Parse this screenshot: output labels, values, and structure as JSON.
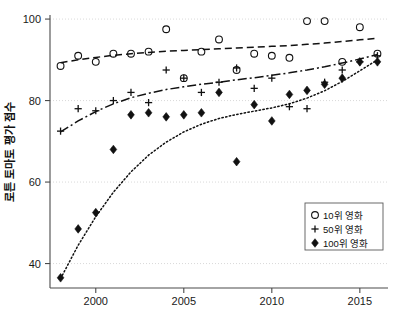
{
  "chart_data": {
    "type": "scatter",
    "title": "",
    "subtitle": "",
    "xlabel": "",
    "ylabel": "로튼 토마토 평가 점수",
    "xlim": [
      1997.4,
      2016.6
    ],
    "ylim": [
      34,
      101
    ],
    "grid": true,
    "x_ticks": [
      2000,
      2005,
      2010,
      2015
    ],
    "x_tick_labels": [
      "2000",
      "2005",
      "2010",
      "2015"
    ],
    "y_ticks": [
      40,
      60,
      80,
      100
    ],
    "y_tick_labels": [
      "40",
      "60",
      "80",
      "100"
    ],
    "legend_position": "lower-right",
    "series": [
      {
        "name": "10위 영화",
        "marker": "open-circle",
        "trend_style": "dashed",
        "x": [
          1998,
          1999,
          2000,
          2001,
          2002,
          2003,
          2004,
          2005,
          2006,
          2007,
          2008,
          2009,
          2010,
          2011,
          2012,
          2013,
          2014,
          2015,
          2016
        ],
        "y": [
          88.5,
          91.0,
          89.5,
          91.5,
          91.5,
          92.0,
          97.5,
          85.5,
          92.0,
          95.0,
          87.5,
          91.5,
          91.0,
          90.5,
          99.5,
          99.5,
          89.5,
          98.0,
          91.5
        ]
      },
      {
        "name": "50위 영화",
        "marker": "plus",
        "trend_style": "dash-dot",
        "x": [
          1998,
          1999,
          2000,
          2001,
          2002,
          2003,
          2004,
          2005,
          2006,
          2007,
          2008,
          2009,
          2010,
          2011,
          2012,
          2013,
          2014,
          2015,
          2016
        ],
        "y": [
          72.5,
          78.0,
          77.5,
          80.0,
          82.0,
          79.5,
          87.5,
          85.5,
          82.0,
          84.5,
          88.0,
          83.0,
          85.5,
          78.5,
          78.0,
          84.5,
          87.5,
          89.5,
          91.0
        ]
      },
      {
        "name": "100위 영화",
        "marker": "filled-diamond",
        "trend_style": "dotted",
        "x": [
          1998,
          1999,
          2000,
          2001,
          2002,
          2003,
          2004,
          2005,
          2006,
          2007,
          2008,
          2009,
          2010,
          2011,
          2012,
          2013,
          2014,
          2015,
          2016
        ],
        "y": [
          36.5,
          48.5,
          52.5,
          68.0,
          76.5,
          77.0,
          76.0,
          76.5,
          77.0,
          82.0,
          65.0,
          79.0,
          75.0,
          81.5,
          82.5,
          84.0,
          85.5,
          89.5,
          89.5
        ]
      }
    ],
    "trend_curves": [
      {
        "name": "10위 영화 추세",
        "style": "dashed",
        "points": [
          [
            1998,
            89.3
          ],
          [
            1999,
            90.0
          ],
          [
            2000,
            90.6
          ],
          [
            2001,
            91.1
          ],
          [
            2002,
            91.5
          ],
          [
            2003,
            91.8
          ],
          [
            2004,
            92.1
          ],
          [
            2005,
            92.3
          ],
          [
            2006,
            92.5
          ],
          [
            2007,
            92.7
          ],
          [
            2008,
            92.9
          ],
          [
            2009,
            93.1
          ],
          [
            2010,
            93.3
          ],
          [
            2011,
            93.5
          ],
          [
            2012,
            93.8
          ],
          [
            2013,
            94.1
          ],
          [
            2014,
            94.5
          ],
          [
            2015,
            94.9
          ],
          [
            2016,
            95.3
          ]
        ]
      },
      {
        "name": "50위 영화 추세",
        "style": "dash-dot",
        "points": [
          [
            1998,
            72.3
          ],
          [
            1999,
            75.0
          ],
          [
            2000,
            77.3
          ],
          [
            2001,
            79.2
          ],
          [
            2002,
            80.7
          ],
          [
            2003,
            81.8
          ],
          [
            2004,
            82.7
          ],
          [
            2005,
            83.4
          ],
          [
            2006,
            84.0
          ],
          [
            2007,
            84.5
          ],
          [
            2008,
            85.1
          ],
          [
            2009,
            85.6
          ],
          [
            2010,
            86.2
          ],
          [
            2011,
            86.8
          ],
          [
            2012,
            87.5
          ],
          [
            2013,
            88.3
          ],
          [
            2014,
            89.2
          ],
          [
            2015,
            90.2
          ],
          [
            2016,
            91.3
          ]
        ]
      },
      {
        "name": "100위 영화 추세",
        "style": "dotted",
        "points": [
          [
            1998,
            36.3
          ],
          [
            1999,
            44.5
          ],
          [
            2000,
            51.5
          ],
          [
            2001,
            57.5
          ],
          [
            2002,
            62.5
          ],
          [
            2003,
            66.6
          ],
          [
            2004,
            69.8
          ],
          [
            2005,
            72.3
          ],
          [
            2006,
            74.2
          ],
          [
            2007,
            75.6
          ],
          [
            2008,
            76.6
          ],
          [
            2009,
            77.4
          ],
          [
            2010,
            78.2
          ],
          [
            2011,
            79.2
          ],
          [
            2012,
            80.6
          ],
          [
            2013,
            82.4
          ],
          [
            2014,
            84.7
          ],
          [
            2015,
            87.3
          ],
          [
            2016,
            90.0
          ]
        ]
      }
    ]
  },
  "legend": {
    "items": [
      {
        "label": "10위 영화",
        "marker": "open-circle"
      },
      {
        "label": "50위 영화",
        "marker": "plus"
      },
      {
        "label": "100위 영화",
        "marker": "filled-diamond"
      }
    ]
  },
  "axes": {
    "y_title": "로튼 토마토 평가 점수"
  }
}
